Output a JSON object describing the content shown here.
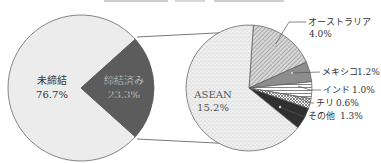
{
  "chart_data": [
    {
      "type": "pie",
      "title": "",
      "name": "main-pie",
      "labels": [
        "未締結",
        "締結済み"
      ],
      "values": [
        76.7,
        23.3
      ],
      "value_labels": [
        "76.7%",
        "23.3%"
      ],
      "colors": [
        "#ececec",
        "#5c5c5c"
      ],
      "label_colors": [
        "#333333",
        "#ffffff"
      ]
    },
    {
      "type": "pie",
      "name": "breakdown-pie",
      "description": "締結済み 23.3% breakdown",
      "labels": [
        "オーストラリア",
        "メキシコ",
        "インド",
        "チリ",
        "その他",
        "ASEAN"
      ],
      "values": [
        4.0,
        1.2,
        1.0,
        0.6,
        1.3,
        15.2
      ],
      "value_labels": [
        "4.0%",
        "1.2%",
        "1.0%",
        "0.6%",
        "1.3%",
        "15.2%"
      ],
      "patterns": [
        "diagonal-hatch",
        "gray-fill",
        "horizontal-lines",
        "crosshatch",
        "dark-fill",
        "dots"
      ]
    }
  ],
  "labels": {
    "unconcluded": {
      "name": "未締結",
      "value": "76.7%"
    },
    "concluded": {
      "name": "締結済み",
      "value": "23.3%"
    },
    "australia": {
      "name": "オーストラリア",
      "value": "4.0%"
    },
    "mexico": {
      "name": "メキシコ",
      "value": "1.2%"
    },
    "india": {
      "name": "インド",
      "value": "1.0%"
    },
    "chile": {
      "name": "チリ",
      "value": "0.6%"
    },
    "other": {
      "name": "その他",
      "value": "1.3%"
    },
    "asean": {
      "name": "ASEAN",
      "value": "15.2%"
    }
  }
}
